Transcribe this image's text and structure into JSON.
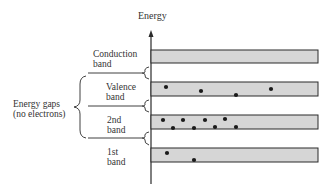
{
  "diagram": {
    "axis_label": "Energy",
    "gap_label_line1": "Energy gaps",
    "gap_label_line2": "(no electrons)",
    "band_fill": "#d6d6d6",
    "line_color": "#2a2a2a",
    "bands": [
      {
        "name": "conduction",
        "line1": "Conduction",
        "line2": "band",
        "electrons": 0
      },
      {
        "name": "valence",
        "line1": "Valence",
        "line2": "band",
        "electrons": 4
      },
      {
        "name": "2nd",
        "line1": "2nd",
        "line2": "band",
        "electrons": 8
      },
      {
        "name": "1st",
        "line1": "1st",
        "line2": "band",
        "electrons": 2
      }
    ]
  }
}
